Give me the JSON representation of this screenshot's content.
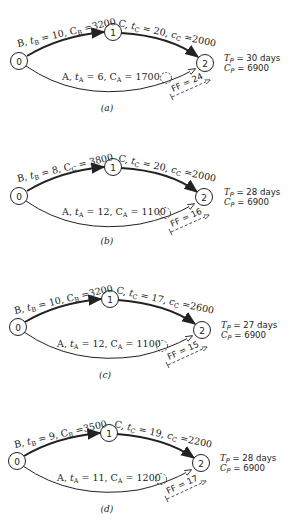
{
  "figure": {
    "panels": [
      {
        "id": "a",
        "caption": "(a)",
        "node0": "0",
        "node1": "1",
        "node2": "2",
        "edgeB": {
          "name": "B",
          "t_sub": "B",
          "t_val": "10",
          "c_sub": "B",
          "c_val": "3200"
        },
        "edgeC": {
          "name": "C",
          "t_sub": "C",
          "t_val": "20",
          "c_sub": "C",
          "c_val": "2000"
        },
        "edgeA": {
          "name": "A",
          "t_sub": "A",
          "t_val": "6",
          "c_sub": "A",
          "c_val": "1700"
        },
        "ff": "FF = 24",
        "tp": {
          "sym": "T",
          "sub": "P",
          "val": "= 30 days"
        },
        "cp": {
          "sym": "C",
          "sub": "P",
          "val": "= 6900"
        }
      },
      {
        "id": "b",
        "caption": "(b)",
        "node0": "0",
        "node1": "1",
        "node2": "2",
        "edgeB": {
          "name": "B",
          "t_sub": "B",
          "t_val": "8",
          "c_sub": "C",
          "c_val": "3800"
        },
        "edgeC": {
          "name": "C",
          "t_sub": "C",
          "t_val": "20",
          "c_sub": "C",
          "c_val": "2000"
        },
        "edgeA": {
          "name": "A",
          "t_sub": "A",
          "t_val": "12",
          "c_sub": "A",
          "c_val": "1100"
        },
        "ff": "FF = 16",
        "tp": {
          "sym": "T",
          "sub": "P",
          "val": "= 28 days"
        },
        "cp": {
          "sym": "C",
          "sub": "P",
          "val": "= 6900"
        }
      },
      {
        "id": "c",
        "caption": "(c)",
        "node0": "0",
        "node1": "1",
        "node2": "2",
        "edgeB": {
          "name": "B",
          "t_sub": "B",
          "t_val": "10",
          "c_sub": "B",
          "c_val": "3200"
        },
        "edgeC": {
          "name": "C",
          "t_sub": "C",
          "t_val": "17",
          "c_sub": "C",
          "c_val": "2600"
        },
        "edgeA": {
          "name": "A",
          "t_sub": "A",
          "t_val": "12",
          "c_sub": "A",
          "c_val": "1100"
        },
        "ff": "FF = 15",
        "tp": {
          "sym": "T",
          "sub": "P",
          "val": "= 27 days"
        },
        "cp": {
          "sym": "C",
          "sub": "P",
          "val": "= 6900"
        }
      },
      {
        "id": "d",
        "caption": "(d)",
        "node0": "0",
        "node1": "1",
        "node2": "2",
        "edgeB": {
          "name": "B",
          "t_sub": "B",
          "t_val": "9",
          "c_sub": "B",
          "c_val": "3500"
        },
        "edgeC": {
          "name": "C",
          "t_sub": "C",
          "t_val": "19",
          "c_sub": "C",
          "c_val": "2200"
        },
        "edgeA": {
          "name": "A",
          "t_sub": "A",
          "t_val": "11",
          "c_sub": "A",
          "c_val": "1200"
        },
        "ff": "FF = 17",
        "tp": {
          "sym": "T",
          "sub": "P",
          "val": "= 28 days"
        },
        "cp": {
          "sym": "C",
          "sub": "P",
          "val": "= 6900"
        }
      }
    ],
    "colors": {
      "ink": "#222222",
      "background": "#ffffff"
    }
  }
}
